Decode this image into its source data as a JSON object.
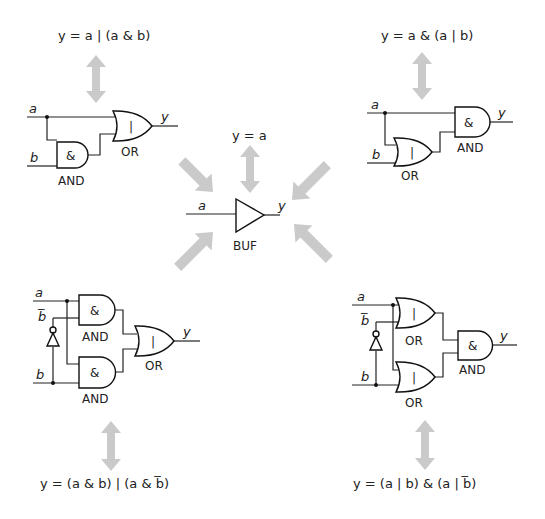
{
  "diagram": {
    "center": {
      "formula": "y = a",
      "gate_label": "BUF",
      "input": "a",
      "output": "y"
    },
    "circuits": [
      {
        "position": "top-left",
        "formula": "y = a | (a & b)",
        "inputs": [
          "a",
          "b"
        ],
        "output": "y",
        "gates": [
          {
            "type": "AND",
            "symbol": "&",
            "label": "AND"
          },
          {
            "type": "OR",
            "symbol": "|",
            "label": "OR"
          }
        ]
      },
      {
        "position": "top-right",
        "formula": "y = a & (a | b)",
        "inputs": [
          "a",
          "b"
        ],
        "output": "y",
        "gates": [
          {
            "type": "OR",
            "symbol": "|",
            "label": "OR"
          },
          {
            "type": "AND",
            "symbol": "&",
            "label": "AND"
          }
        ]
      },
      {
        "position": "bottom-left",
        "formula": "y = (a & b) | (a & b̅)",
        "inputs": [
          "a",
          "b̅",
          "b"
        ],
        "output": "y",
        "gates": [
          {
            "type": "AND",
            "symbol": "&",
            "label": "AND"
          },
          {
            "type": "AND",
            "symbol": "&",
            "label": "AND"
          },
          {
            "type": "OR",
            "symbol": "|",
            "label": "OR"
          },
          {
            "type": "NOT",
            "symbol": "",
            "label": ""
          }
        ]
      },
      {
        "position": "bottom-right",
        "formula": "y = (a | b) & (a | b̅)",
        "inputs": [
          "a",
          "b̅",
          "b"
        ],
        "output": "y",
        "gates": [
          {
            "type": "OR",
            "symbol": "|",
            "label": "OR"
          },
          {
            "type": "OR",
            "symbol": "|",
            "label": "OR"
          },
          {
            "type": "AND",
            "symbol": "&",
            "label": "AND"
          },
          {
            "type": "NOT",
            "symbol": "",
            "label": ""
          }
        ]
      }
    ],
    "arrow_color": "#cacaca",
    "line_color": "#222222"
  }
}
